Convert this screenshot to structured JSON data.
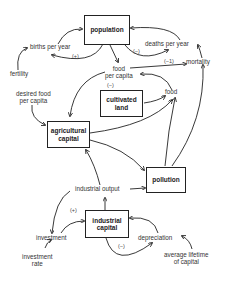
{
  "diagram": {
    "stocks": [
      {
        "id": "population",
        "label": "population"
      },
      {
        "id": "cultivated_land",
        "label": "cultivated land"
      },
      {
        "id": "agricultural_capital",
        "label": "agricultural capital"
      },
      {
        "id": "pollution",
        "label": "pollution"
      },
      {
        "id": "industrial_capital",
        "label": "industrial capital"
      }
    ],
    "variables": {
      "births_per_year": "births per year",
      "deaths_per_year": "deaths per year",
      "fertility": "fertility",
      "mortality": "mortality",
      "food_per_capita_1": "food",
      "food_per_capita_2": "per capita",
      "desired_food_1": "desired food",
      "desired_food_2": "per capita",
      "food": "food",
      "industrial_output": "industrial output",
      "investment": "investment",
      "investment_rate_1": "investment",
      "investment_rate_2": "rate",
      "depreciation": "depreciation",
      "avg_lifetime_1": "average lifetime",
      "avg_lifetime_2": "of capital"
    },
    "loop_signs": {
      "births": "(+)",
      "deaths": "(−)",
      "mortality_food": "(−1)",
      "food_pc": "(−)",
      "investment": "(+)",
      "depreciation": "(−)"
    }
  }
}
